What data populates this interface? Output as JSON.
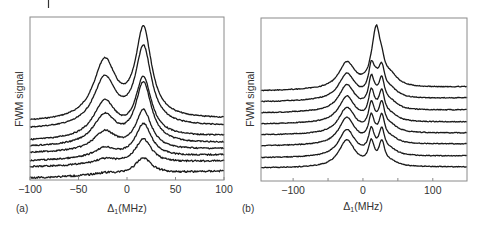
{
  "chart_data": [
    {
      "panel": "(a)",
      "type": "line",
      "title": "",
      "xlabel": "Δ1(MHz)",
      "xlabel_main": "Δ",
      "xlabel_sub": "1",
      "xlabel_unit": "(MHz)",
      "ylabel": "FWM signal",
      "xlim": [
        -100,
        100
      ],
      "xticks": [
        -100,
        -50,
        0,
        50,
        100
      ],
      "xtick_labels": [
        "−100",
        "−50",
        "0",
        "50",
        "100"
      ],
      "grid": false,
      "legend": null,
      "frame": {
        "x0": 30,
        "x1": 224,
        "y0": 17,
        "y1": 180
      },
      "peaks": [
        {
          "center": -23,
          "width": 14,
          "shape": "lorentz"
        },
        {
          "center": 17,
          "width": 10,
          "shape": "lorentz"
        }
      ],
      "series": [
        {
          "name": "trace 1",
          "baseline_left": 122,
          "baseline_right": 119,
          "left_peak": 58,
          "right_peak": 88,
          "noise": 0.5
        },
        {
          "name": "trace 2",
          "baseline_left": 129,
          "baseline_right": 126,
          "left_peak": 48,
          "right_peak": 77,
          "noise": 0.5
        },
        {
          "name": "trace 3",
          "baseline_left": 141,
          "baseline_right": 136,
          "left_peak": 36,
          "right_peak": 58,
          "noise": 0.6
        },
        {
          "name": "trace 4",
          "baseline_left": 147,
          "baseline_right": 143,
          "left_peak": 29,
          "right_peak": 60,
          "noise": 0.6
        },
        {
          "name": "trace 5",
          "baseline_left": 153,
          "baseline_right": 149,
          "left_peak": 19,
          "right_peak": 39,
          "noise": 0.7
        },
        {
          "name": "trace 6",
          "baseline_left": 161,
          "baseline_right": 155,
          "left_peak": 10,
          "right_peak": 33,
          "noise": 0.7
        },
        {
          "name": "trace 7",
          "baseline_left": 167,
          "baseline_right": 161,
          "left_peak": 5,
          "right_peak": 24,
          "noise": 0.8
        },
        {
          "name": "trace 8",
          "baseline_left": 178,
          "baseline_right": 171,
          "left_peak": 2,
          "right_peak": 16,
          "noise": 0.9
        }
      ]
    },
    {
      "panel": "(b)",
      "type": "line",
      "title": "",
      "xlabel": "Δ1(MHz)",
      "xlabel_main": "Δ",
      "xlabel_sub": "1",
      "xlabel_unit": "(MHz)",
      "ylabel": "FWM signal",
      "xlim": [
        -146,
        149
      ],
      "xticks": [
        -100,
        -50,
        0,
        50,
        100
      ],
      "xtick_labels": [
        "−100",
        "",
        "0",
        "",
        "100"
      ],
      "grid": false,
      "legend": null,
      "frame": {
        "x0": 261,
        "x1": 467,
        "y0": 18,
        "y1": 181
      },
      "peaks": [
        {
          "center": -23,
          "width": 14,
          "shape": "lorentz"
        },
        {
          "center": 12,
          "width": 5,
          "shape": "lorentz"
        },
        {
          "center": 27,
          "width": 5,
          "shape": "lorentz"
        },
        {
          "center": 19,
          "width": 7,
          "shape": "lorentz"
        }
      ],
      "series": [
        {
          "name": "trace 1",
          "baseline_left": 91,
          "baseline_right": 87,
          "amps": [
            26,
            4,
            12,
            54
          ],
          "shoulder": 10,
          "noise": 0.4
        },
        {
          "name": "trace 2",
          "baseline_left": 102,
          "baseline_right": 98,
          "amps": [
            26,
            26,
            24,
            12
          ],
          "shoulder": 8,
          "noise": 0.4
        },
        {
          "name": "trace 3",
          "baseline_left": 113,
          "baseline_right": 110,
          "amps": [
            26,
            27,
            25,
            6
          ],
          "shoulder": 7,
          "noise": 0.4
        },
        {
          "name": "trace 4",
          "baseline_left": 124,
          "baseline_right": 122,
          "amps": [
            26,
            26,
            25,
            4
          ],
          "shoulder": 6,
          "noise": 0.4
        },
        {
          "name": "trace 5",
          "baseline_left": 135,
          "baseline_right": 133,
          "amps": [
            26,
            25,
            25,
            3
          ],
          "shoulder": 6,
          "noise": 0.4
        },
        {
          "name": "trace 6",
          "baseline_left": 146,
          "baseline_right": 144,
          "amps": [
            27,
            24,
            24,
            2
          ],
          "shoulder": 5,
          "noise": 0.4
        },
        {
          "name": "trace 7",
          "baseline_left": 158,
          "baseline_right": 156,
          "amps": [
            27,
            23,
            23,
            1
          ],
          "shoulder": 5,
          "noise": 0.4
        },
        {
          "name": "trace 8",
          "baseline_left": 168,
          "baseline_right": 167,
          "amps": [
            27,
            22,
            22,
            0
          ],
          "shoulder": 4,
          "noise": 0.4
        }
      ]
    }
  ],
  "figure": {
    "panel_a_label": "(a)",
    "panel_b_label": "(b)",
    "ylabel": "FWM signal",
    "line_color": "#1a1a1a",
    "frame_color": "#8a8a8a"
  }
}
